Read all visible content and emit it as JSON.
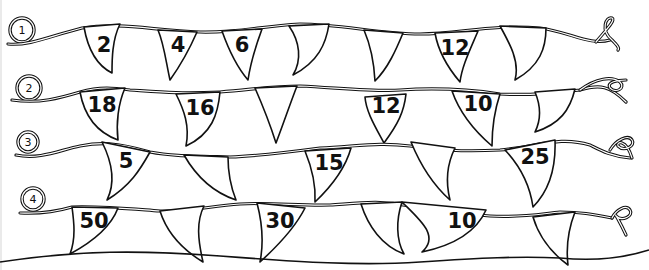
{
  "diagram": {
    "rows": [
      {
        "label": "1",
        "flags": [
          {
            "text": "2"
          },
          {
            "text": "4"
          },
          {
            "text": "6"
          },
          {
            "text": ""
          },
          {
            "text": ""
          },
          {
            "text": "12"
          },
          {
            "text": ""
          }
        ]
      },
      {
        "label": "2",
        "flags": [
          {
            "text": "18"
          },
          {
            "text": "16"
          },
          {
            "text": ""
          },
          {
            "text": "12"
          },
          {
            "text": "10"
          },
          {
            "text": ""
          }
        ]
      },
      {
        "label": "3",
        "flags": [
          {
            "text": "5"
          },
          {
            "text": ""
          },
          {
            "text": "15"
          },
          {
            "text": ""
          },
          {
            "text": "25"
          }
        ]
      },
      {
        "label": "4",
        "flags": [
          {
            "text": "50"
          },
          {
            "text": ""
          },
          {
            "text": "30"
          },
          {
            "text": ""
          },
          {
            "text": "10"
          },
          {
            "text": ""
          }
        ]
      }
    ]
  }
}
